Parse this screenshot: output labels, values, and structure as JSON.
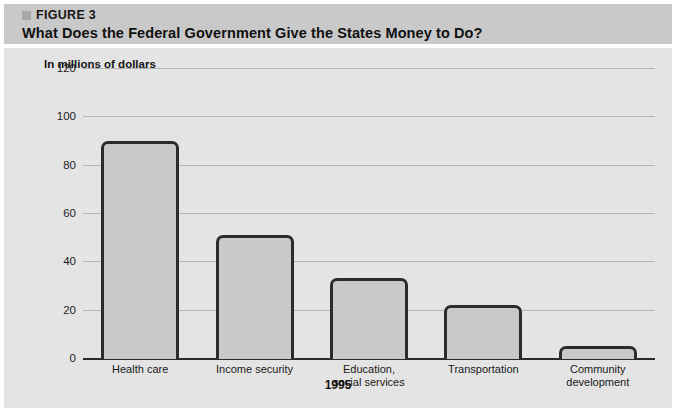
{
  "header": {
    "figure_marker": "square-marker",
    "figure_label": "FIGURE 3",
    "title": "What Does the Federal Government Give the States Money to Do?",
    "band_color": "#c9c9c9"
  },
  "panel": {
    "background": "#e4e4e4",
    "gridline_color": "#b4b4b4",
    "axis_color": "#2b2b2b",
    "bar_fill": "#c9c9c9",
    "bar_border": "#2b2b2b"
  },
  "chart_data": {
    "type": "bar",
    "title": "What Does the Federal Government Give the States Money to Do?",
    "subtitle": "FIGURE 3",
    "ylabel": "In millions of dollars",
    "xlabel": "1995",
    "categories": [
      "Health care",
      "Income security",
      "Education,\nsocial services",
      "Transportation",
      "Community\ndevelopment"
    ],
    "category_lines": [
      [
        "Health care"
      ],
      [
        "Income security"
      ],
      [
        "Education,",
        "social services"
      ],
      [
        "Transportation"
      ],
      [
        "Community",
        "development"
      ]
    ],
    "values": [
      90,
      51,
      33,
      22,
      5
    ],
    "ylim": [
      0,
      120
    ],
    "yticks": [
      0,
      20,
      40,
      60,
      80,
      100,
      120
    ],
    "ytick_labels": [
      "0",
      "20",
      "40",
      "60",
      "80",
      "100",
      "120"
    ],
    "grid": true,
    "legend": false
  }
}
